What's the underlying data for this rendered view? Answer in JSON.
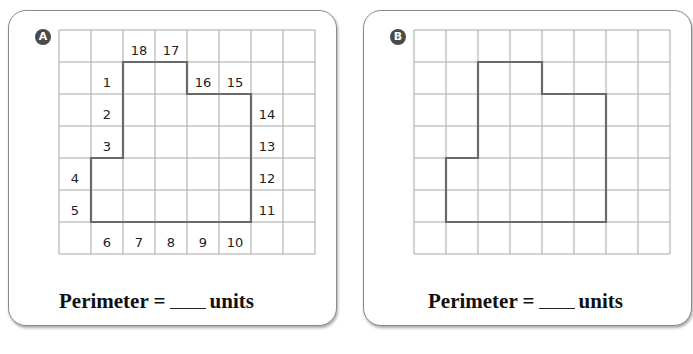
{
  "problems": [
    {
      "id": "A",
      "badge": "A",
      "grid": {
        "cols": 8,
        "rows": 7,
        "cell_px": 32
      },
      "shape_outline": [
        [
          1,
          4
        ],
        [
          2,
          4
        ],
        [
          2,
          1
        ],
        [
          4,
          1
        ],
        [
          4,
          2
        ],
        [
          6,
          2
        ],
        [
          6,
          6
        ],
        [
          1,
          6
        ]
      ],
      "side_labels": [
        {
          "n": "1",
          "col": 1,
          "row": 1
        },
        {
          "n": "2",
          "col": 1,
          "row": 2
        },
        {
          "n": "3",
          "col": 1,
          "row": 3
        },
        {
          "n": "4",
          "col": 0,
          "row": 4
        },
        {
          "n": "5",
          "col": 0,
          "row": 5
        },
        {
          "n": "6",
          "col": 1,
          "row": 6
        },
        {
          "n": "7",
          "col": 2,
          "row": 6
        },
        {
          "n": "8",
          "col": 3,
          "row": 6
        },
        {
          "n": "9",
          "col": 4,
          "row": 6
        },
        {
          "n": "10",
          "col": 5,
          "row": 6
        },
        {
          "n": "11",
          "col": 6,
          "row": 5
        },
        {
          "n": "12",
          "col": 6,
          "row": 4
        },
        {
          "n": "13",
          "col": 6,
          "row": 3
        },
        {
          "n": "14",
          "col": 6,
          "row": 2
        },
        {
          "n": "15",
          "col": 5,
          "row": 1
        },
        {
          "n": "16",
          "col": 4,
          "row": 1
        },
        {
          "n": "17",
          "col": 3,
          "row": 0
        },
        {
          "n": "18",
          "col": 2,
          "row": 0
        }
      ],
      "perimeter_label": "Perimeter =",
      "units_label": "units"
    },
    {
      "id": "B",
      "badge": "B",
      "grid": {
        "cols": 8,
        "rows": 7,
        "cell_px": 32
      },
      "shape_outline": [
        [
          1,
          4
        ],
        [
          2,
          4
        ],
        [
          2,
          1
        ],
        [
          4,
          1
        ],
        [
          4,
          2
        ],
        [
          6,
          2
        ],
        [
          6,
          6
        ],
        [
          1,
          6
        ]
      ],
      "side_labels": [],
      "perimeter_label": "Perimeter =",
      "units_label": "units"
    }
  ],
  "colors": {
    "grid_line": "#a8a8a8",
    "outline": "#6a6a6a",
    "badge_bg": "#4a4a4a"
  }
}
